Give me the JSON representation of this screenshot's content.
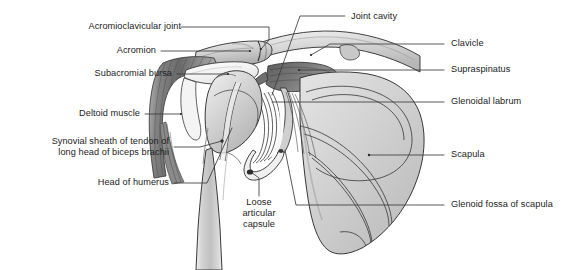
{
  "figure": {
    "background_color": "#ffffff",
    "text_color": "#1c1c1c",
    "leader_line_color": "#3b3b3b",
    "width": 579,
    "height": 270
  },
  "labels": {
    "acromioclavicular_joint": "Acromioclavicular joint",
    "acromion": "Acromion",
    "subacromial_bursa": "Subacromial bursa",
    "deltoid_muscle": "Deltoid muscle",
    "synovial_sheath_line1": "Synovial sheath of tendon of",
    "synovial_sheath_line2": "long head of biceps brachii",
    "head_of_humerus": "Head of humerus",
    "loose_articular_capsule_line1": "Loose",
    "loose_articular_capsule_line2": "articular",
    "loose_articular_capsule_line3": "capsule",
    "joint_cavity": "Joint cavity",
    "clavicle": "Clavicle",
    "supraspinatus": "Supraspinatus",
    "glenoidal_labrum": "Glenoidal labrum",
    "scapula": "Scapula",
    "glenoid_fossa_of_scapula": "Glenoid fossa of scapula"
  },
  "structures": {
    "bone_fill_light": "#dcdcdc",
    "bone_fill_mid": "#c9c9c9",
    "bone_fill_dark": "#b0b0b0",
    "muscle_dark": "#8d8d8d",
    "muscle_darker": "#6f6f6f",
    "cavity_white": "#fdfdfd",
    "outline": "#2e2e2e"
  }
}
